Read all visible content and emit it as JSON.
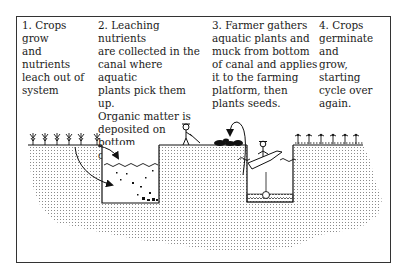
{
  "figure": {
    "steps": [
      {
        "number": 1,
        "text": "1. Crops grow\nand nutrients\nleach out of\nsystem"
      },
      {
        "number": 2,
        "text": "2. Leaching nutrients\nare collected in the\ncanal where aquatic\nplants pick them up.\nOrganic matter is\ndeposited on bottom\nof canal."
      },
      {
        "number": 3,
        "text": "3. Farmer gathers\naquatic plants and\nmuck from bottom\nof canal and applies\nit to the farming\nplatform, then\nplants seeds."
      },
      {
        "number": 4,
        "text": "4. Crops\ngerminate and\ngrow, starting\ncycle over\nagain."
      }
    ],
    "illustration": {
      "elements": [
        "crops-row-left",
        "canal-1-with-water-and-sediment",
        "nutrient-flow-arrows",
        "farmer-on-platform",
        "muck-pile",
        "muck-toss-arrow",
        "farmer-in-boat",
        "canal-2-with-muck-bottom",
        "crops-row-right"
      ]
    }
  }
}
